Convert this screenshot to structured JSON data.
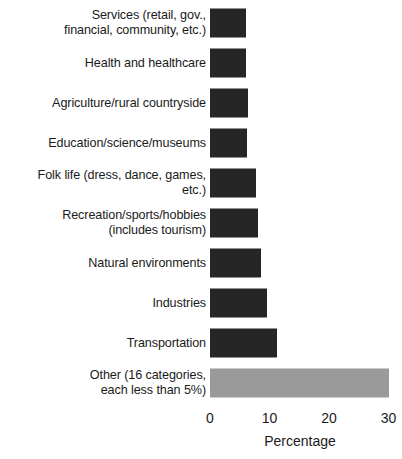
{
  "chart_data": {
    "type": "bar",
    "orientation": "horizontal",
    "title": "",
    "xlabel": "Percentage",
    "ylabel": "",
    "xlim": [
      0,
      30
    ],
    "xticks": [
      0,
      10,
      20,
      30
    ],
    "xtick_labels": [
      "0",
      "10",
      "20",
      "30"
    ],
    "grid": false,
    "legend": null,
    "categories": [
      "Services (retail, gov.,\nfinancial, community, etc.)",
      "Health and healthcare",
      "Agriculture/rural countryside",
      "Education/science/museums",
      "Folk life (dress, dance, games,\netc.)",
      "Recreation/sports/hobbies\n(includes tourism)",
      "Natural environments",
      "Industries",
      "Transportation",
      "Other (16 categories,\neach less than 5%)"
    ],
    "values": [
      6.1,
      6.1,
      6.4,
      6.3,
      7.8,
      8.1,
      8.6,
      9.5,
      11.2,
      30.0
    ],
    "bar_colors": [
      "#262626",
      "#262626",
      "#262626",
      "#262626",
      "#262626",
      "#262626",
      "#262626",
      "#262626",
      "#262626",
      "#9a9a9a"
    ]
  },
  "axis": {
    "title": "Percentage"
  }
}
